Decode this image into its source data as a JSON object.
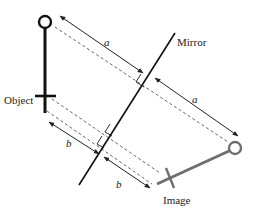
{
  "diagram": {
    "type": "plane-mirror-reflection",
    "labels": {
      "mirror": "Mirror",
      "object": "Object",
      "image": "Image",
      "distance_a": "a",
      "distance_b": "b"
    },
    "colors": {
      "object": "#111111",
      "image": "#6e6e6e",
      "mirror": "#111111",
      "dashed": "#555555",
      "arrow": "#222222"
    }
  }
}
